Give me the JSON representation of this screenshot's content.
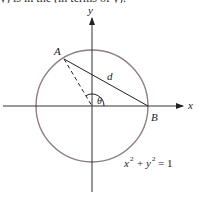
{
  "header": {
    "cut_off_text": "y) is in the (in terms of y)."
  },
  "diagram": {
    "axes": {
      "x_label": "x",
      "y_label": "y"
    },
    "points": {
      "A": "A",
      "B": "B"
    },
    "segment_label": "d",
    "angle_label": "θ",
    "equation": {
      "base_x": "x",
      "base_y": "y",
      "exp": "2",
      "plus": "+",
      "equals": "= 1"
    },
    "colors": {
      "circle": "#8f7f80",
      "lines": "#222222"
    }
  }
}
